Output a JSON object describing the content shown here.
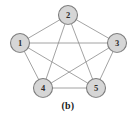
{
  "figure": {
    "caption": "(b)",
    "background_color": "#ffffff"
  },
  "style": {
    "node_fill": "#d6d6d6",
    "node_stroke": "#7d7d7d",
    "edge_color": "#8c8c8c",
    "label_color": "#2b2b2b",
    "node_radius": 9.5
  },
  "chart_data": {
    "type": "diagram",
    "graph_type": "complete-graph",
    "title": "(b)",
    "node_count": 5,
    "edge_count": 10,
    "nodes": [
      {
        "id": "1",
        "label": "1",
        "x": 20,
        "y": 43
      },
      {
        "id": "2",
        "label": "2",
        "x": 68,
        "y": 15
      },
      {
        "id": "3",
        "label": "3",
        "x": 117,
        "y": 43
      },
      {
        "id": "4",
        "label": "4",
        "x": 43,
        "y": 88
      },
      {
        "id": "5",
        "label": "5",
        "x": 96,
        "y": 88
      }
    ],
    "edges": [
      {
        "from": "1",
        "to": "2"
      },
      {
        "from": "2",
        "to": "3"
      },
      {
        "from": "3",
        "to": "5"
      },
      {
        "from": "5",
        "to": "4"
      },
      {
        "from": "4",
        "to": "1"
      },
      {
        "from": "1",
        "to": "3"
      },
      {
        "from": "1",
        "to": "5"
      },
      {
        "from": "2",
        "to": "4"
      },
      {
        "from": "2",
        "to": "5"
      },
      {
        "from": "3",
        "to": "4"
      }
    ]
  }
}
